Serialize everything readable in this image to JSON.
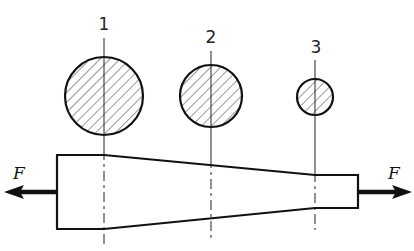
{
  "diagram": {
    "sections": [
      {
        "label": "1",
        "x": 104,
        "circle_cy": 96,
        "circle_r": 39
      },
      {
        "label": "2",
        "x": 211,
        "circle_cy": 96,
        "circle_r": 31
      },
      {
        "label": "3",
        "x": 315,
        "circle_cy": 97,
        "circle_r": 18
      }
    ],
    "forces": {
      "left": {
        "label": "F",
        "direction": "left"
      },
      "right": {
        "label": "F",
        "direction": "right"
      }
    },
    "colors": {
      "stroke": "#111111",
      "background": "#ffffff"
    }
  }
}
